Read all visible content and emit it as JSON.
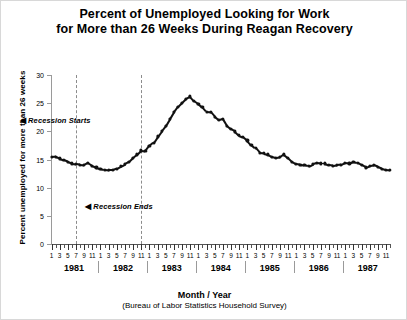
{
  "title": {
    "line1": "Percent of Unemployed Looking for Work",
    "line2": "for More than 26 Weeks During Reagan Recovery"
  },
  "axes": {
    "ylabel": "Percent unemployed for more than 26 weeks",
    "xlabel_main": "Month / Year",
    "xlabel_sub": "(Bureau of Labor Statistics Household Survey)",
    "ytick_labels": [
      "0",
      "5",
      "10",
      "15",
      "20",
      "25",
      "30"
    ],
    "month_tick_labels": [
      "1",
      "3",
      "5",
      "7",
      "9",
      "11"
    ],
    "year_labels": [
      "1981",
      "1982",
      "1983",
      "1984",
      "1985",
      "1986",
      "1987"
    ]
  },
  "annotations": [
    {
      "name": "recession-start",
      "arrow": "◀",
      "text": "Recession Starts",
      "year": 1981,
      "month": 7
    },
    {
      "name": "recession-end",
      "arrow": "◀",
      "text": "Recession Ends",
      "year": 1982,
      "month": 11
    }
  ],
  "colors": {
    "series": "#111111",
    "axis": "#555555",
    "gridline": "#8c8c8c",
    "frame": "#d8d8d8",
    "background": "#ffffff"
  },
  "chart_data": {
    "type": "line",
    "title": "Percent of Unemployed Looking for Work for More than 26 Weeks During Reagan Recovery",
    "xlabel": "Month / Year",
    "ylabel": "Percent unemployed for more than 26 weeks",
    "ylim": [
      0,
      30
    ],
    "ytick_step": 5,
    "grid": false,
    "legend": "none",
    "x_start": {
      "year": 1981,
      "month": 1
    },
    "x_end": {
      "year": 1987,
      "month": 12
    },
    "x": [
      "1981-01",
      "1981-02",
      "1981-03",
      "1981-04",
      "1981-05",
      "1981-06",
      "1981-07",
      "1981-08",
      "1981-09",
      "1981-10",
      "1981-11",
      "1981-12",
      "1982-01",
      "1982-02",
      "1982-03",
      "1982-04",
      "1982-05",
      "1982-06",
      "1982-07",
      "1982-08",
      "1982-09",
      "1982-10",
      "1982-11",
      "1982-12",
      "1983-01",
      "1983-02",
      "1983-03",
      "1983-04",
      "1983-05",
      "1983-06",
      "1983-07",
      "1983-08",
      "1983-09",
      "1983-10",
      "1983-11",
      "1983-12",
      "1984-01",
      "1984-02",
      "1984-03",
      "1984-04",
      "1984-05",
      "1984-06",
      "1984-07",
      "1984-08",
      "1984-09",
      "1984-10",
      "1984-11",
      "1984-12",
      "1985-01",
      "1985-02",
      "1985-03",
      "1985-04",
      "1985-05",
      "1985-06",
      "1985-07",
      "1985-08",
      "1985-09",
      "1985-10",
      "1985-11",
      "1985-12",
      "1986-01",
      "1986-02",
      "1986-03",
      "1986-04",
      "1986-05",
      "1986-06",
      "1986-07",
      "1986-08",
      "1986-09",
      "1986-10",
      "1986-11",
      "1986-12",
      "1987-01",
      "1987-02",
      "1987-03",
      "1987-04",
      "1987-05",
      "1987-06",
      "1987-07",
      "1987-08",
      "1987-09",
      "1987-10",
      "1987-11",
      "1987-12"
    ],
    "values": [
      15.4,
      15.5,
      15.2,
      14.9,
      14.6,
      14.3,
      14.2,
      14.1,
      14.0,
      14.4,
      13.9,
      13.6,
      13.4,
      13.2,
      13.1,
      13.1,
      13.4,
      13.8,
      14.2,
      14.6,
      15.3,
      15.9,
      16.6,
      16.5,
      17.4,
      18.0,
      19.1,
      20.1,
      21.0,
      22.2,
      23.4,
      24.4,
      25.1,
      25.8,
      26.2,
      25.4,
      24.9,
      24.3,
      23.5,
      23.4,
      22.6,
      22.0,
      22.2,
      21.0,
      20.4,
      20.0,
      19.3,
      19.0,
      18.4,
      17.6,
      17.0,
      16.2,
      16.1,
      15.9,
      15.5,
      15.3,
      15.4,
      15.9,
      15.3,
      14.6,
      14.2,
      14.1,
      14.0,
      13.8,
      14.2,
      14.4,
      14.3,
      14.3,
      14.0,
      13.9,
      14.0,
      14.1,
      14.4,
      14.3,
      14.6,
      14.4,
      14.0,
      13.6,
      13.9,
      14.0,
      13.7,
      13.4,
      13.2,
      13.1
    ]
  }
}
